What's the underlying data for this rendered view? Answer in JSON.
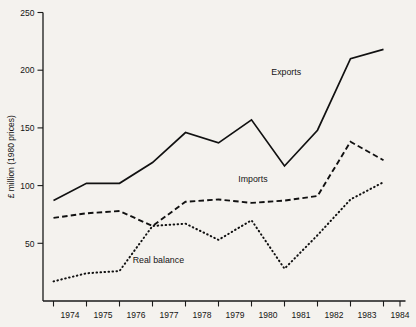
{
  "chart_data": {
    "type": "line",
    "title": "",
    "xlabel": "",
    "ylabel": "£ million (1980 prices)",
    "x": [
      1974,
      1975,
      1976,
      1977,
      1978,
      1979,
      1980,
      1981,
      1982,
      1983,
      1984
    ],
    "categories": [
      "1974",
      "1975",
      "1976",
      "1977",
      "1978",
      "1979",
      "1980",
      "1981",
      "1982",
      "1983",
      "1984"
    ],
    "xlim": [
      1974,
      1984
    ],
    "ylim": [
      0,
      250
    ],
    "yticks": [
      50,
      100,
      150,
      200,
      250
    ],
    "ytick_labels": [
      "50",
      "100",
      "150",
      "200",
      "250"
    ],
    "grid": false,
    "legend_position": "inline-annotations",
    "series": [
      {
        "name": "Exports",
        "style": "solid",
        "label_text": "Exports",
        "values": [
          87,
          102,
          102,
          120,
          146,
          137,
          157,
          117,
          148,
          210,
          218
        ]
      },
      {
        "name": "Imports",
        "style": "dashed",
        "label_text": "Imports",
        "values": [
          72,
          76,
          78,
          65,
          86,
          88,
          85,
          87,
          91,
          138,
          122
        ]
      },
      {
        "name": "Real balance",
        "style": "dotted",
        "label_text": "Real balance",
        "values": [
          17,
          24,
          26,
          65,
          67,
          53,
          70,
          28,
          57,
          88,
          103
        ]
      }
    ],
    "annotations": [
      {
        "text": "Exports",
        "x": 1980.6,
        "y": 196
      },
      {
        "text": "Imports",
        "x": 1979.6,
        "y": 103
      },
      {
        "text": "Real balance",
        "x": 1976.4,
        "y": 33
      }
    ]
  },
  "colors": {
    "background": "#f4f2ee",
    "ink": "#111111"
  }
}
